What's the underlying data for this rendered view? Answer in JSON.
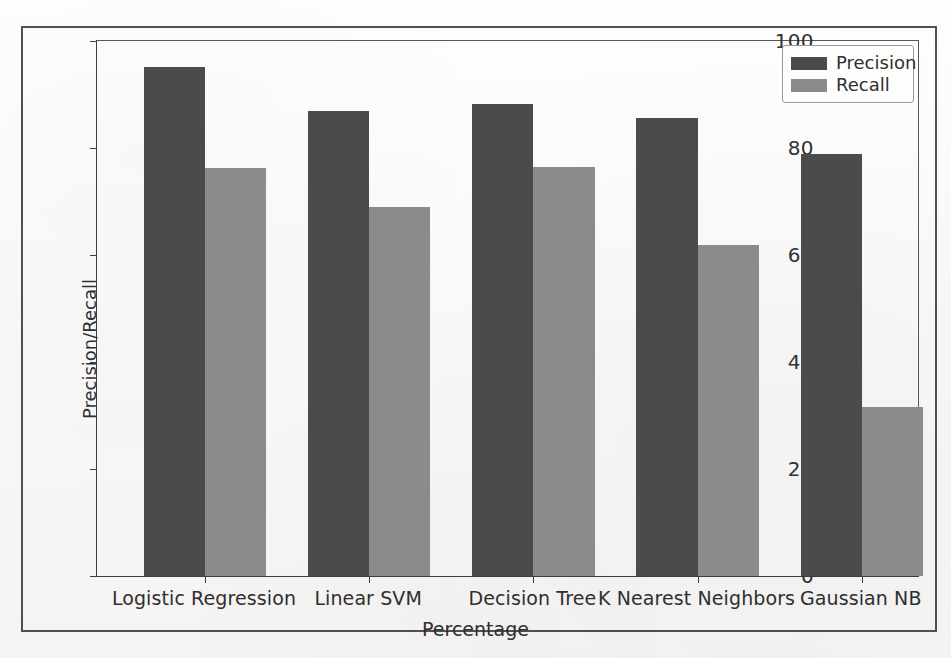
{
  "chart_data": {
    "type": "bar",
    "title": "",
    "subtitle": "",
    "xlabel": "Percentage",
    "ylabel": "Precision/Recall",
    "categories": [
      "Logistic Regression",
      "Linear SVM",
      "Decision Tree",
      "K Nearest Neighbors",
      "Gaussian NB"
    ],
    "series": [
      {
        "name": "Precision",
        "color": "#4b4b4e",
        "values": [
          95.2,
          87.0,
          88.3,
          85.7,
          78.8
        ]
      },
      {
        "name": "Recall",
        "color": "#8b8b8d",
        "values": [
          76.2,
          68.9,
          76.5,
          61.8,
          31.5
        ]
      }
    ],
    "ylim": [
      0,
      100
    ],
    "yticks": [
      0,
      20,
      40,
      60,
      80,
      100
    ],
    "ytick_labels": [
      "0",
      "20",
      "40",
      "60",
      "80",
      "100"
    ],
    "xtick_labels": [
      "Logistic Regression",
      "Linear SVM",
      "Decision Tree",
      "K Nearest Neighbors",
      "Gaussian NB"
    ],
    "grid": false,
    "legend_position": "upper right",
    "legend_entries": [
      "Precision",
      "Recall"
    ],
    "annotations": []
  },
  "axes": {
    "ylabel": "Precision/Recall",
    "xlabel": "Percentage",
    "yticks": [
      {
        "label": "100",
        "value": 100
      },
      {
        "label": "80",
        "value": 80
      },
      {
        "label": "60",
        "value": 60
      },
      {
        "label": "40",
        "value": 40
      },
      {
        "label": "20",
        "value": 20
      },
      {
        "label": "0",
        "value": 0
      }
    ],
    "xticks": [
      {
        "label": "Logistic Regression"
      },
      {
        "label": "Linear SVM"
      },
      {
        "label": "Decision Tree"
      },
      {
        "label": "K Nearest Neighbors"
      },
      {
        "label": "Gaussian NB"
      }
    ]
  },
  "legend": {
    "entries": [
      {
        "label": "Precision",
        "color": "#4b4b4e"
      },
      {
        "label": "Recall",
        "color": "#8b8b8d"
      }
    ]
  },
  "colors": {
    "precision": "#4b4b4e",
    "recall": "#8b8b8d",
    "axis": "#3c3d3f",
    "frame": "#4f5052",
    "text": "#2e2f31",
    "background": "#fbfbfa"
  }
}
